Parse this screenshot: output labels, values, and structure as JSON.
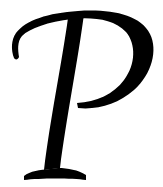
{
  "glyph": {
    "character": "P",
    "style": "italic script serif",
    "color": "#000000",
    "background": "#ffffff"
  }
}
